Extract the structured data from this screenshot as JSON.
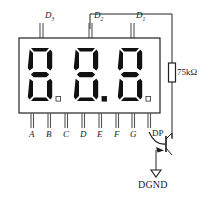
{
  "diagram": {
    "colors": {
      "wire": "#262626",
      "segment_on": "#111111",
      "body_fill": "#ffffff",
      "body_stroke": "#222222",
      "text": "#1a1a1a"
    },
    "display": {
      "type": "3-digit-7-segment",
      "digits": [
        {
          "name": "digit-3",
          "value": "8",
          "decimal_point": "off"
        },
        {
          "name": "digit-2",
          "value": "8",
          "decimal_point": "on"
        },
        {
          "name": "digit-1",
          "value": "8",
          "decimal_point": "off"
        }
      ]
    },
    "top_pins": [
      {
        "name": "digit-select-3",
        "label": "D",
        "subscript": "3"
      },
      {
        "name": "digit-select-2",
        "label": "D",
        "subscript": "2"
      },
      {
        "name": "digit-select-1",
        "label": "D",
        "subscript": "1"
      }
    ],
    "bottom_pins": [
      {
        "name": "segment-a",
        "label": "A",
        "italic": true
      },
      {
        "name": "segment-b",
        "label": "B",
        "italic": true
      },
      {
        "name": "segment-c",
        "label": "C",
        "italic": true
      },
      {
        "name": "segment-d",
        "label": "D",
        "italic": true
      },
      {
        "name": "segment-e",
        "label": "E",
        "italic": true
      },
      {
        "name": "segment-f",
        "label": "F",
        "italic": true
      },
      {
        "name": "segment-g",
        "label": "G",
        "italic": true
      },
      {
        "name": "decimal-point",
        "label": "DP",
        "italic": false
      }
    ],
    "components": [
      {
        "name": "pullup-resistor",
        "type": "resistor",
        "value": "75kΩ"
      },
      {
        "name": "driver-transistor",
        "type": "npn-transistor",
        "value": ""
      },
      {
        "name": "ground-symbol",
        "type": "ground",
        "value": "DGND"
      }
    ],
    "resistor": {
      "label": "75kΩ"
    },
    "ground": {
      "label": "DGND"
    }
  }
}
